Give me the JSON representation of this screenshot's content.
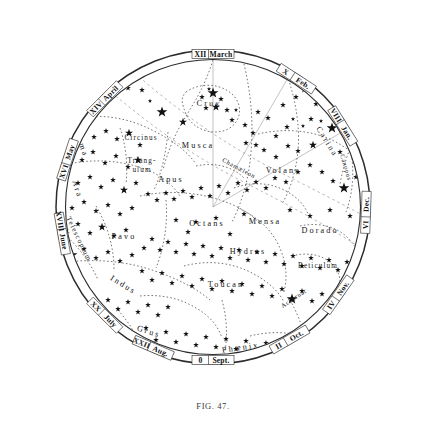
{
  "figure": {
    "caption": "FIG. 47.",
    "center": {
      "x": 213,
      "y": 207
    },
    "radius_outer": 157,
    "radius_inner": 148,
    "colors": {
      "ink": "#111111",
      "paper": "#ffffff",
      "boundary": "#444444",
      "caption": "#3a3a3a"
    }
  },
  "ring": {
    "description": "Outer annulus carrying right-ascension hour numerals and month names",
    "labels": [
      {
        "hour": "XII",
        "month": "March",
        "angle_deg": 0
      },
      {
        "hour": "XIV",
        "month": "April",
        "angle_deg": -45
      },
      {
        "hour": "XVI",
        "month": "May",
        "angle_deg": -72
      },
      {
        "hour": "XVIII",
        "month": "June",
        "angle_deg": -100
      },
      {
        "hour": "XX",
        "month": "July",
        "angle_deg": -135
      },
      {
        "hour": "XXII",
        "month": "Aug.",
        "angle_deg": -157
      },
      {
        "hour": "0",
        "month": "Sept.",
        "angle_deg": 180
      },
      {
        "hour": "II",
        "month": "Oct.",
        "angle_deg": 150
      },
      {
        "hour": "IV",
        "month": "Nov.",
        "angle_deg": 125
      },
      {
        "hour": "VI",
        "month": "Dec.",
        "angle_deg": 92
      },
      {
        "hour": "VIII",
        "month": "Jan.",
        "angle_deg": 58
      },
      {
        "hour": "X",
        "month": "Feb.",
        "angle_deg": 33
      }
    ]
  },
  "constellations": [
    {
      "name": "Centaurus",
      "x": 192,
      "y": 52,
      "rot": -8,
      "size": "lg"
    },
    {
      "name": "Lupus",
      "x": 96,
      "y": 92,
      "rot": 62,
      "size": "lg"
    },
    {
      "name": "Crux",
      "x": 209,
      "y": 106,
      "rot": 2,
      "size": "lg"
    },
    {
      "name": "Vela",
      "x": 316,
      "y": 79,
      "rot": 28,
      "size": "lg"
    },
    {
      "name": "Norma",
      "x": 78,
      "y": 142,
      "rot": 70,
      "size": "lg"
    },
    {
      "name": "Circinus",
      "x": 141,
      "y": 140,
      "rot": 0,
      "size": "sm"
    },
    {
      "name": "Musca",
      "x": 198,
      "y": 148,
      "rot": 0,
      "size": "lg"
    },
    {
      "name": "Carina",
      "x": 325,
      "y": 143,
      "rot": 58,
      "size": "lg"
    },
    {
      "name": "Triang-",
      "x": 142,
      "y": 163,
      "rot": 0,
      "size": "sm"
    },
    {
      "name": "ulum",
      "x": 142,
      "y": 172,
      "rot": 0,
      "size": "sm"
    },
    {
      "name": "Volans",
      "x": 283,
      "y": 173,
      "rot": 0,
      "size": "lg"
    },
    {
      "name": "Chamæleon",
      "x": 238,
      "y": 170,
      "rot": 28,
      "size": "tiny"
    },
    {
      "name": "Apus",
      "x": 171,
      "y": 182,
      "rot": 0,
      "size": "lg"
    },
    {
      "name": "Ara",
      "x": 75,
      "y": 190,
      "rot": 72,
      "size": "lg"
    },
    {
      "name": "Argo",
      "x": 372,
      "y": 178,
      "rot": 78,
      "size": "lg"
    },
    {
      "name": "Canopus",
      "x": 344,
      "y": 168,
      "rot": 74,
      "size": "tiny"
    },
    {
      "name": "Telescopium",
      "x": 77,
      "y": 240,
      "rot": 64,
      "size": "sm"
    },
    {
      "name": "Pavo",
      "x": 124,
      "y": 239,
      "rot": 0,
      "size": "lg"
    },
    {
      "name": "Octans",
      "x": 207,
      "y": 226,
      "rot": 0,
      "size": "lg"
    },
    {
      "name": "Mensa",
      "x": 265,
      "y": 224,
      "rot": 0,
      "size": "lg"
    },
    {
      "name": "Dorado",
      "x": 320,
      "y": 233,
      "rot": 0,
      "size": "lg"
    },
    {
      "name": "Pictor",
      "x": 372,
      "y": 231,
      "rot": 104,
      "size": "sm"
    },
    {
      "name": "Hydrus",
      "x": 248,
      "y": 254,
      "rot": 0,
      "size": "lg"
    },
    {
      "name": "Reticulum",
      "x": 318,
      "y": 268,
      "rot": 0,
      "size": "sm"
    },
    {
      "name": "Indus",
      "x": 122,
      "y": 287,
      "rot": 32,
      "size": "lg"
    },
    {
      "name": "Toucan",
      "x": 226,
      "y": 287,
      "rot": 0,
      "size": "lg"
    },
    {
      "name": "Achernar",
      "x": 295,
      "y": 300,
      "rot": -34,
      "size": "tiny"
    },
    {
      "name": "Horologium",
      "x": 336,
      "y": 300,
      "rot": -40,
      "size": "tiny"
    },
    {
      "name": "Sculptor",
      "x": 382,
      "y": 280,
      "rot": -58,
      "size": "tiny"
    },
    {
      "name": "Grus",
      "x": 148,
      "y": 334,
      "rot": 18,
      "size": "lg"
    },
    {
      "name": "Phœnix",
      "x": 241,
      "y": 350,
      "rot": -8,
      "size": "lg"
    },
    {
      "name": "Eridanus",
      "x": 330,
      "y": 332,
      "rot": -36,
      "size": "tiny"
    },
    {
      "name": "Scorpio",
      "x": 45,
      "y": 182,
      "rot": 74,
      "size": "tiny"
    },
    {
      "name": "Corona Aust.",
      "x": 58,
      "y": 219,
      "rot": 62,
      "size": "tiny"
    },
    {
      "name": "Sagittarius",
      "x": 62,
      "y": 253,
      "rot": 52,
      "size": "tiny"
    }
  ],
  "chart_data": {
    "type": "scatter",
    "projection": "polar / azimuthal equidistant, south pole at centre",
    "xlabel": "Right ascension (hours, roman numerals on rim)",
    "ylabel": "Declination (centre = south pole, rim = celestial equator region)",
    "grid": false,
    "legend": "none",
    "magnitude_key": {
      "1": 5.6,
      "2": 4.2,
      "3": 3.0,
      "4": 2.2,
      "5": 1.6
    },
    "stars": [
      [
        196,
        49,
        1
      ],
      [
        212,
        55,
        3
      ],
      [
        224,
        57,
        3
      ],
      [
        160,
        62,
        3
      ],
      [
        138,
        72,
        3
      ],
      [
        249,
        62,
        3
      ],
      [
        271,
        61,
        3
      ],
      [
        283,
        57,
        3
      ],
      [
        104,
        77,
        3
      ],
      [
        118,
        68,
        3
      ],
      [
        91,
        88,
        3
      ],
      [
        99,
        99,
        4
      ],
      [
        112,
        95,
        3
      ],
      [
        128,
        88,
        3
      ],
      [
        142,
        90,
        3
      ],
      [
        150,
        101,
        4
      ],
      [
        162,
        112,
        1
      ],
      [
        183,
        122,
        2
      ],
      [
        209,
        89,
        4
      ],
      [
        202,
        97,
        3
      ],
      [
        213,
        93,
        1
      ],
      [
        221,
        99,
        3
      ],
      [
        216,
        107,
        2
      ],
      [
        206,
        108,
        3
      ],
      [
        227,
        110,
        3
      ],
      [
        236,
        110,
        4
      ],
      [
        232,
        120,
        3
      ],
      [
        245,
        125,
        3
      ],
      [
        253,
        133,
        3
      ],
      [
        258,
        112,
        3
      ],
      [
        268,
        118,
        3
      ],
      [
        283,
        105,
        3
      ],
      [
        296,
        97,
        3
      ],
      [
        304,
        90,
        3
      ],
      [
        316,
        104,
        3
      ],
      [
        331,
        96,
        3
      ],
      [
        341,
        93,
        3
      ],
      [
        329,
        81,
        3
      ],
      [
        338,
        74,
        3
      ],
      [
        352,
        103,
        4
      ],
      [
        361,
        96,
        3
      ],
      [
        293,
        119,
        4
      ],
      [
        303,
        126,
        4
      ],
      [
        287,
        127,
        3
      ],
      [
        276,
        136,
        3
      ],
      [
        311,
        119,
        3
      ],
      [
        321,
        121,
        4
      ],
      [
        332,
        128,
        1
      ],
      [
        345,
        124,
        3
      ],
      [
        353,
        121,
        3
      ],
      [
        366,
        121,
        3
      ],
      [
        372,
        129,
        3
      ],
      [
        380,
        139,
        3
      ],
      [
        313,
        145,
        2
      ],
      [
        298,
        151,
        3
      ],
      [
        288,
        146,
        3
      ],
      [
        276,
        157,
        3
      ],
      [
        264,
        150,
        3
      ],
      [
        256,
        145,
        3
      ],
      [
        246,
        143,
        3
      ],
      [
        340,
        152,
        3
      ],
      [
        351,
        148,
        3
      ],
      [
        362,
        157,
        3
      ],
      [
        372,
        166,
        3
      ],
      [
        379,
        176,
        3
      ],
      [
        368,
        186,
        3
      ],
      [
        356,
        177,
        3
      ],
      [
        344,
        188,
        1
      ],
      [
        333,
        181,
        3
      ],
      [
        322,
        172,
        3
      ],
      [
        310,
        165,
        3
      ],
      [
        298,
        172,
        3
      ],
      [
        286,
        182,
        3
      ],
      [
        275,
        178,
        3
      ],
      [
        266,
        188,
        3
      ],
      [
        256,
        182,
        3
      ],
      [
        247,
        190,
        3
      ],
      [
        238,
        183,
        3
      ],
      [
        228,
        193,
        3
      ],
      [
        219,
        186,
        3
      ],
      [
        210,
        196,
        3
      ],
      [
        201,
        188,
        3
      ],
      [
        192,
        197,
        3
      ],
      [
        183,
        191,
        3
      ],
      [
        174,
        199,
        3
      ],
      [
        166,
        193,
        3
      ],
      [
        157,
        200,
        3
      ],
      [
        148,
        194,
        3
      ],
      [
        72,
        132,
        3
      ],
      [
        85,
        124,
        3
      ],
      [
        94,
        137,
        3
      ],
      [
        106,
        131,
        3
      ],
      [
        117,
        139,
        3
      ],
      [
        129,
        133,
        2
      ],
      [
        140,
        145,
        3
      ],
      [
        70,
        151,
        3
      ],
      [
        82,
        160,
        3
      ],
      [
        93,
        152,
        3
      ],
      [
        105,
        163,
        3
      ],
      [
        116,
        156,
        3
      ],
      [
        128,
        167,
        3
      ],
      [
        138,
        160,
        2
      ],
      [
        66,
        175,
        3
      ],
      [
        78,
        183,
        3
      ],
      [
        90,
        177,
        3
      ],
      [
        101,
        187,
        3
      ],
      [
        113,
        180,
        3
      ],
      [
        124,
        190,
        2
      ],
      [
        136,
        183,
        3
      ],
      [
        60,
        200,
        3
      ],
      [
        72,
        208,
        3
      ],
      [
        84,
        202,
        3
      ],
      [
        96,
        211,
        3
      ],
      [
        108,
        205,
        3
      ],
      [
        120,
        214,
        3
      ],
      [
        132,
        208,
        3
      ],
      [
        54,
        222,
        3
      ],
      [
        66,
        230,
        3
      ],
      [
        78,
        224,
        3
      ],
      [
        90,
        233,
        3
      ],
      [
        102,
        227,
        2
      ],
      [
        114,
        236,
        3
      ],
      [
        126,
        230,
        3
      ],
      [
        60,
        247,
        3
      ],
      [
        72,
        255,
        1
      ],
      [
        84,
        249,
        3
      ],
      [
        96,
        258,
        3
      ],
      [
        108,
        252,
        3
      ],
      [
        120,
        261,
        3
      ],
      [
        132,
        255,
        3
      ],
      [
        48,
        240,
        3
      ],
      [
        42,
        215,
        3
      ],
      [
        38,
        192,
        2
      ],
      [
        144,
        248,
        3
      ],
      [
        152,
        239,
        3
      ],
      [
        160,
        250,
        3
      ],
      [
        168,
        242,
        3
      ],
      [
        176,
        252,
        3
      ],
      [
        186,
        244,
        3
      ],
      [
        194,
        254,
        3
      ],
      [
        203,
        246,
        3
      ],
      [
        212,
        256,
        3
      ],
      [
        221,
        248,
        3
      ],
      [
        230,
        258,
        3
      ],
      [
        239,
        250,
        3
      ],
      [
        248,
        260,
        3
      ],
      [
        257,
        252,
        3
      ],
      [
        266,
        262,
        3
      ],
      [
        275,
        254,
        3
      ],
      [
        284,
        264,
        3
      ],
      [
        293,
        256,
        3
      ],
      [
        302,
        266,
        3
      ],
      [
        311,
        258,
        3
      ],
      [
        320,
        268,
        3
      ],
      [
        329,
        260,
        3
      ],
      [
        338,
        270,
        3
      ],
      [
        347,
        262,
        3
      ],
      [
        356,
        272,
        3
      ],
      [
        142,
        271,
        3
      ],
      [
        152,
        280,
        3
      ],
      [
        162,
        273,
        3
      ],
      [
        172,
        283,
        3
      ],
      [
        182,
        276,
        3
      ],
      [
        192,
        286,
        3
      ],
      [
        202,
        279,
        3
      ],
      [
        212,
        289,
        3
      ],
      [
        222,
        281,
        3
      ],
      [
        232,
        291,
        3
      ],
      [
        242,
        284,
        3
      ],
      [
        252,
        294,
        3
      ],
      [
        262,
        286,
        3
      ],
      [
        272,
        296,
        3
      ],
      [
        282,
        289,
        3
      ],
      [
        292,
        299,
        1
      ],
      [
        302,
        291,
        3
      ],
      [
        312,
        301,
        3
      ],
      [
        322,
        294,
        3
      ],
      [
        332,
        304,
        3
      ],
      [
        342,
        296,
        3
      ],
      [
        108,
        300,
        3
      ],
      [
        118,
        309,
        3
      ],
      [
        128,
        302,
        3
      ],
      [
        138,
        312,
        3
      ],
      [
        148,
        305,
        3
      ],
      [
        158,
        315,
        3
      ],
      [
        168,
        307,
        3
      ],
      [
        124,
        330,
        2
      ],
      [
        136,
        338,
        2
      ],
      [
        146,
        328,
        3
      ],
      [
        156,
        340,
        3
      ],
      [
        166,
        332,
        3
      ],
      [
        176,
        342,
        3
      ],
      [
        186,
        334,
        3
      ],
      [
        196,
        345,
        3
      ],
      [
        206,
        337,
        3
      ],
      [
        216,
        347,
        3
      ],
      [
        226,
        339,
        3
      ],
      [
        236,
        349,
        3
      ],
      [
        246,
        341,
        3
      ],
      [
        256,
        351,
        3
      ],
      [
        266,
        343,
        3
      ],
      [
        276,
        353,
        3
      ],
      [
        286,
        345,
        3
      ],
      [
        296,
        355,
        3
      ],
      [
        306,
        347,
        3
      ],
      [
        316,
        343,
        3
      ],
      [
        326,
        350,
        3
      ],
      [
        206,
        367,
        3
      ],
      [
        186,
        362,
        3
      ],
      [
        166,
        360,
        3
      ],
      [
        146,
        357,
        3
      ],
      [
        246,
        362,
        3
      ],
      [
        266,
        357,
        3
      ],
      [
        196,
        222,
        3
      ],
      [
        216,
        218,
        3
      ],
      [
        188,
        232,
        3
      ],
      [
        230,
        234,
        3
      ],
      [
        176,
        220,
        3
      ],
      [
        244,
        214,
        3
      ],
      [
        290,
        210,
        3
      ],
      [
        310,
        216,
        3
      ],
      [
        330,
        210,
        3
      ],
      [
        350,
        216,
        3
      ],
      [
        370,
        210,
        3
      ]
    ]
  },
  "boundary_paths": {
    "description": "Dotted constellation boundary curves and dashed Milky Way edges",
    "count": 28
  }
}
